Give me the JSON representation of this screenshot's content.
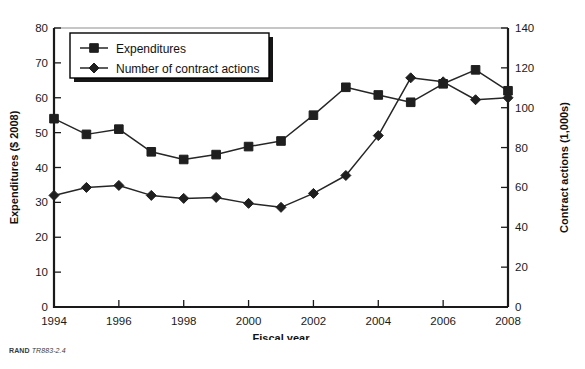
{
  "figure": {
    "source_note_prefix": "RAND",
    "source_note_id": "TR883-2.4"
  },
  "legend": {
    "position": "top-left-inside",
    "entries": [
      {
        "label": "Expenditures",
        "marker": "square"
      },
      {
        "label": "Number of contract actions",
        "marker": "diamond"
      }
    ]
  },
  "chart_data": {
    "type": "line",
    "title": "",
    "subtitle": "",
    "xlabel": "Fiscal year",
    "ylabel": "Expenditures ($ 2008)",
    "y2label": "Contract actions (1,000s)",
    "grid": false,
    "legend_position": "upper left",
    "x": [
      1994,
      1995,
      1996,
      1997,
      1998,
      1999,
      2000,
      2001,
      2002,
      2003,
      2004,
      2005,
      2006,
      2007,
      2008
    ],
    "categories": [
      "1994",
      "1995",
      "1996",
      "1997",
      "1998",
      "1999",
      "2000",
      "2001",
      "2002",
      "2003",
      "2004",
      "2005",
      "2006",
      "2007",
      "2008"
    ],
    "xlim": [
      1994,
      2008
    ],
    "xticks": [
      1994,
      1996,
      1998,
      2000,
      2002,
      2004,
      2006,
      2008
    ],
    "xticklabels": [
      "1994",
      "1996",
      "1998",
      "2000",
      "2002",
      "2004",
      "2006",
      "2008"
    ],
    "ylim": [
      0,
      80
    ],
    "yticks": [
      0,
      10,
      20,
      30,
      40,
      50,
      60,
      70,
      80
    ],
    "yticklabels": [
      "0",
      "10",
      "20",
      "30",
      "40",
      "50",
      "60",
      "70",
      "80"
    ],
    "y2lim": [
      0,
      140
    ],
    "y2ticks": [
      0,
      20,
      40,
      60,
      80,
      100,
      120,
      140
    ],
    "y2ticklabels": [
      "0",
      "20",
      "40",
      "60",
      "80",
      "100",
      "120",
      "140"
    ],
    "series": [
      {
        "name": "Expenditures",
        "axis": "left",
        "marker": "square",
        "color": "#1f1f1f",
        "values": [
          54.0,
          49.5,
          51.0,
          44.5,
          42.3,
          43.7,
          46.0,
          47.6,
          55.0,
          63.0,
          60.8,
          58.7,
          64.0,
          68.0,
          62.0
        ]
      },
      {
        "name": "Number of contract actions",
        "axis": "right",
        "marker": "diamond",
        "color": "#1f1f1f",
        "values": [
          56,
          60,
          61,
          56,
          54.5,
          55,
          52,
          50,
          57,
          66,
          86,
          115,
          113,
          104,
          105
        ]
      }
    ]
  }
}
